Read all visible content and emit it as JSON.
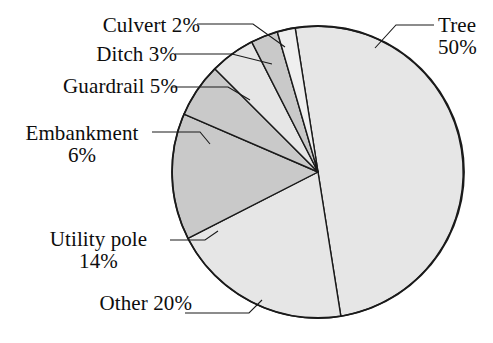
{
  "chart_data": {
    "type": "pie",
    "title": "",
    "subtitle": "",
    "xlabel": "",
    "ylabel": "",
    "legend_position": "none",
    "grid": false,
    "labels_show_percent": true,
    "total_percent": 100,
    "categories": [
      "Tree",
      "Other",
      "Utility pole",
      "Embankment",
      "Guardrail",
      "Ditch",
      "Culvert"
    ],
    "values": [
      50,
      20,
      14,
      6,
      5,
      3,
      2
    ],
    "slices": [
      {
        "name": "Tree",
        "percent": 50,
        "label": "Tree",
        "value_label": "50%",
        "fill": "#e6e6e6",
        "start_angle": -9,
        "end_angle": 171
      },
      {
        "name": "Other",
        "percent": 20,
        "label": "Other 20%",
        "value_label": "20%",
        "fill": "#e6e6e6",
        "start_angle": 171,
        "end_angle": 243
      },
      {
        "name": "Utility pole",
        "percent": 14,
        "label": "Utility pole",
        "value_label": "14%",
        "fill": "#c9c9c9",
        "start_angle": 243,
        "end_angle": 293.4
      },
      {
        "name": "Embankment",
        "percent": 6,
        "label": "Embankment",
        "value_label": "6%",
        "fill": "#c9c9c9",
        "start_angle": 293.4,
        "end_angle": 315
      },
      {
        "name": "Guardrail",
        "percent": 5,
        "label": "Guardrail 5%",
        "value_label": "5%",
        "fill": "#e6e6e6",
        "start_angle": 315,
        "end_angle": 333
      },
      {
        "name": "Ditch",
        "percent": 3,
        "label": "Ditch 3%",
        "value_label": "3%",
        "fill": "#c9c9c9",
        "start_angle": 333,
        "end_angle": 343.8
      },
      {
        "name": "Culvert",
        "percent": 2,
        "label": "Culvert 2%",
        "value_label": "2%",
        "fill": "#efefef",
        "start_angle": 343.8,
        "end_angle": 351
      }
    ],
    "colors": {
      "light_gray": "#e6e6e6",
      "medium_gray": "#c9c9c9",
      "pale_gray": "#efefef",
      "outline": "#1a1a1a",
      "background": "#ffffff",
      "text": "#0d0d0d"
    },
    "geometry": {
      "center_x": 318,
      "center_y": 172,
      "radius": 146
    }
  },
  "labels": {
    "culvert": {
      "line1": "Culvert 2%"
    },
    "ditch": {
      "line1": "Ditch 3%"
    },
    "guardrail": {
      "line1": "Guardrail 5%"
    },
    "embankment": {
      "line1": "Embankment",
      "line2": "6%"
    },
    "utility": {
      "line1": "Utility pole",
      "line2": "14%"
    },
    "other": {
      "line1": "Other 20%"
    },
    "tree": {
      "line1": "Tree",
      "line2": "50%"
    }
  }
}
